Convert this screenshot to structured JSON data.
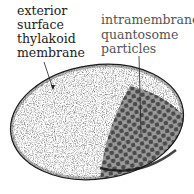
{
  "labels": {
    "exterior": [
      "exterior",
      "surface",
      "thylakoid",
      "membrane"
    ],
    "intramembrane": [
      "intramembrane",
      "quantosome",
      "particles"
    ]
  },
  "colors": {
    "outline": "#1a1a1a",
    "stipple": "#555555",
    "particle_field": "#9a9a9a",
    "particle": "#4a4a4a",
    "background": "#ffffff"
  },
  "shape": {
    "type": "ellipse",
    "cx": 97,
    "cy": 122,
    "rx": 87,
    "ry": 57,
    "rotation": -8
  }
}
